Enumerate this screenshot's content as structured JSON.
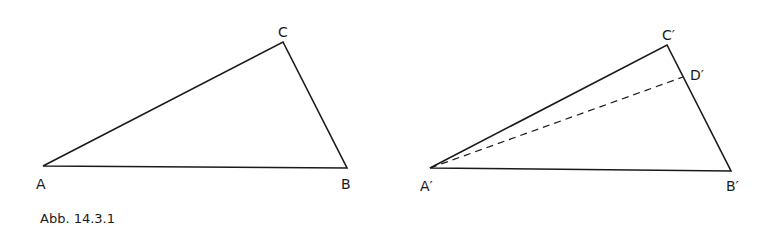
{
  "figure": {
    "caption": "Abb. 14.3.1",
    "stroke_color": "#1a1a1a",
    "background": "#ffffff"
  },
  "left_triangle": {
    "vertices": {
      "A": {
        "label": "A",
        "x": 43,
        "y": 166
      },
      "B": {
        "label": "B",
        "x": 347,
        "y": 168
      },
      "C": {
        "label": "C",
        "x": 283,
        "y": 42
      }
    }
  },
  "right_triangle": {
    "vertices": {
      "A": {
        "label": "A′",
        "x": 430,
        "y": 168
      },
      "B": {
        "label": "B′",
        "x": 731,
        "y": 171
      },
      "C": {
        "label": "C′",
        "x": 667,
        "y": 45
      }
    },
    "point_D": {
      "label": "D′",
      "x": 683,
      "y": 77
    },
    "dashed_segment": "A′D′"
  }
}
